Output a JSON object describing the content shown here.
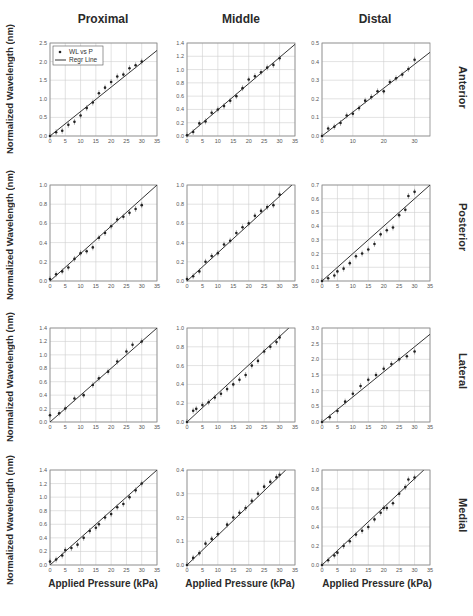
{
  "figure": {
    "column_titles": [
      "Proximal",
      "Middle",
      "Distal"
    ],
    "row_labels": [
      "Anterior",
      "Posterior",
      "Lateral",
      "Medial"
    ],
    "ylabel": "Normalized Wavelength (nm)",
    "xlabel": "Applied Pressure (kPa)",
    "legend": [
      "WL vs P",
      "Regr Line"
    ]
  },
  "chart_data": [
    {
      "type": "scatter",
      "row": "Anterior",
      "col": "Proximal",
      "title": "Proximal",
      "xlabel": "",
      "ylabel": "Normalized Wavelength (nm)",
      "xlim": [
        0,
        35
      ],
      "ylim": [
        0,
        2.5
      ],
      "xticks": [
        0,
        5,
        10,
        15,
        20,
        25,
        30,
        35
      ],
      "yticks": [
        "0.0",
        "0.5",
        "1.0",
        "1.5",
        "2.0",
        "2.5"
      ],
      "legend": [
        "WL vs P",
        "Regr Line"
      ],
      "legend_position": "upper left",
      "grid": true,
      "x": [
        0,
        2,
        4,
        6,
        8,
        10,
        12,
        14,
        16,
        18,
        20,
        22,
        24,
        26,
        28,
        30
      ],
      "y": [
        0.0,
        0.1,
        0.14,
        0.3,
        0.38,
        0.55,
        0.75,
        0.9,
        1.15,
        1.3,
        1.45,
        1.6,
        1.65,
        1.82,
        1.9,
        2.0
      ],
      "regression": [
        [
          0,
          0
        ],
        [
          35,
          2.3
        ]
      ]
    },
    {
      "type": "scatter",
      "row": "Anterior",
      "col": "Middle",
      "title": "Middle",
      "xlim": [
        0,
        35
      ],
      "ylim": [
        0,
        1.4
      ],
      "xticks": [
        0,
        5,
        10,
        15,
        20,
        25,
        30,
        35
      ],
      "yticks": [
        "0.0",
        "0.2",
        "0.4",
        "0.6",
        "0.8",
        "1.0",
        "1.2",
        "1.4"
      ],
      "grid": true,
      "x": [
        0,
        2,
        4,
        6,
        8,
        10,
        12,
        14,
        16,
        18,
        20,
        22,
        24,
        26,
        28,
        30
      ],
      "y": [
        0.01,
        0.06,
        0.19,
        0.22,
        0.35,
        0.4,
        0.45,
        0.53,
        0.6,
        0.72,
        0.85,
        0.9,
        0.96,
        1.03,
        1.07,
        1.17
      ],
      "regression": [
        [
          0,
          0
        ],
        [
          35,
          1.38
        ]
      ]
    },
    {
      "type": "scatter",
      "row": "Anterior",
      "col": "Distal",
      "title": "Distal",
      "xlim": [
        0,
        35
      ],
      "ylim": [
        0,
        0.5
      ],
      "xticks": [
        0,
        10,
        20,
        30
      ],
      "yticks": [
        "0.0",
        "0.1",
        "0.2",
        "0.3",
        "0.4",
        "0.5"
      ],
      "grid": true,
      "x": [
        0,
        2,
        4,
        6,
        8,
        10,
        12,
        14,
        16,
        18,
        20,
        22,
        24,
        26,
        28,
        30
      ],
      "y": [
        0.0,
        0.04,
        0.05,
        0.07,
        0.11,
        0.12,
        0.15,
        0.19,
        0.21,
        0.24,
        0.24,
        0.29,
        0.31,
        0.33,
        0.36,
        0.41
      ],
      "regression": [
        [
          0,
          0
        ],
        [
          35,
          0.45
        ]
      ]
    },
    {
      "type": "scatter",
      "row": "Posterior",
      "col": "Proximal",
      "xlim": [
        0,
        35
      ],
      "ylim": [
        0,
        1.0
      ],
      "xticks": [
        0,
        5,
        10,
        15,
        20,
        25,
        30,
        35
      ],
      "yticks": [
        "0.0",
        "0.2",
        "0.4",
        "0.6",
        "0.8",
        "1.0"
      ],
      "grid": true,
      "x": [
        0,
        2,
        4,
        6,
        8,
        10,
        12,
        14,
        16,
        18,
        20,
        22,
        24,
        26,
        28,
        30
      ],
      "y": [
        0.02,
        0.07,
        0.1,
        0.14,
        0.23,
        0.29,
        0.31,
        0.35,
        0.45,
        0.5,
        0.57,
        0.64,
        0.67,
        0.71,
        0.75,
        0.79,
        0.9
      ],
      "regression": [
        [
          0,
          0
        ],
        [
          35,
          1.0
        ]
      ]
    },
    {
      "type": "scatter",
      "row": "Posterior",
      "col": "Middle",
      "xlim": [
        0,
        35
      ],
      "ylim": [
        0,
        1.0
      ],
      "xticks": [
        0,
        5,
        10,
        15,
        20,
        25,
        30,
        35
      ],
      "yticks": [
        "0.0",
        "0.2",
        "0.4",
        "0.6",
        "0.8",
        "1.0"
      ],
      "grid": true,
      "x": [
        0,
        2,
        4,
        6,
        8,
        10,
        12,
        14,
        16,
        18,
        20,
        22,
        24,
        26,
        28,
        30
      ],
      "y": [
        0.02,
        0.05,
        0.1,
        0.2,
        0.26,
        0.29,
        0.38,
        0.42,
        0.5,
        0.56,
        0.6,
        0.68,
        0.73,
        0.77,
        0.79,
        0.9
      ],
      "regression": [
        [
          0,
          0
        ],
        [
          34,
          1.0
        ]
      ]
    },
    {
      "type": "scatter",
      "row": "Posterior",
      "col": "Distal",
      "xlim": [
        0,
        35
      ],
      "ylim": [
        0,
        0.7
      ],
      "xticks": [
        0,
        5,
        10,
        15,
        20,
        25,
        30,
        35
      ],
      "yticks": [
        "0.0",
        "0.1",
        "0.2",
        "0.3",
        "0.4",
        "0.5",
        "0.6",
        "0.7"
      ],
      "grid": true,
      "x": [
        0,
        2,
        4,
        5,
        7,
        9,
        11,
        13,
        15,
        17,
        19,
        21,
        23,
        25,
        27,
        28,
        30
      ],
      "y": [
        0.0,
        0.02,
        0.04,
        0.07,
        0.09,
        0.13,
        0.18,
        0.2,
        0.23,
        0.27,
        0.34,
        0.37,
        0.39,
        0.48,
        0.52,
        0.62,
        0.65
      ],
      "regression": [
        [
          0,
          0
        ],
        [
          35,
          0.7
        ]
      ]
    },
    {
      "type": "scatter",
      "row": "Lateral",
      "col": "Proximal",
      "ylabel": "Normalized Wavelength (nm)",
      "xlim": [
        0,
        35
      ],
      "ylim": [
        0,
        1.4
      ],
      "xticks": [
        0,
        5,
        10,
        15,
        20,
        25,
        30,
        35
      ],
      "yticks": [
        "0.0",
        "0.2",
        "0.4",
        "0.6",
        "0.8",
        "1.0",
        "1.2",
        "1.4"
      ],
      "grid": true,
      "x": [
        0,
        3,
        5,
        8,
        11,
        14,
        16,
        19,
        22,
        25,
        27,
        30
      ],
      "y": [
        0.1,
        0.13,
        0.2,
        0.35,
        0.4,
        0.55,
        0.65,
        0.75,
        0.9,
        1.05,
        1.15,
        1.2
      ],
      "regression": [
        [
          0,
          0
        ],
        [
          35,
          1.4
        ]
      ]
    },
    {
      "type": "scatter",
      "row": "Lateral",
      "col": "Middle",
      "xlim": [
        0,
        35
      ],
      "ylim": [
        0,
        1.0
      ],
      "xticks": [
        0,
        5,
        10,
        15,
        20,
        25,
        30,
        35
      ],
      "yticks": [
        "0.0",
        "0.2",
        "0.4",
        "0.6",
        "0.8",
        "1.0"
      ],
      "grid": true,
      "x": [
        0,
        2,
        3,
        5,
        7,
        9,
        11,
        13,
        15,
        17,
        19,
        21,
        23,
        25,
        27,
        29,
        30
      ],
      "y": [
        0.0,
        0.12,
        0.14,
        0.18,
        0.21,
        0.26,
        0.3,
        0.35,
        0.4,
        0.45,
        0.5,
        0.6,
        0.65,
        0.75,
        0.8,
        0.85,
        0.9
      ],
      "regression": [
        [
          0,
          0
        ],
        [
          33,
          1.0
        ]
      ]
    },
    {
      "type": "scatter",
      "row": "Lateral",
      "col": "Distal",
      "xlim": [
        0,
        35
      ],
      "ylim": [
        0,
        3.0
      ],
      "xticks": [
        0,
        5,
        10,
        15,
        20,
        25,
        30,
        35
      ],
      "yticks": [
        "0.0",
        "0.5",
        "1.0",
        "1.5",
        "2.0",
        "2.5",
        "3.0"
      ],
      "grid": true,
      "x": [
        0,
        2.5,
        5,
        7.5,
        10,
        12.5,
        15,
        17.5,
        20,
        22.5,
        25,
        27.5,
        30
      ],
      "y": [
        0.0,
        0.15,
        0.35,
        0.65,
        0.9,
        1.15,
        1.35,
        1.5,
        1.7,
        1.85,
        2.0,
        2.1,
        2.25
      ],
      "regression": [
        [
          0,
          0
        ],
        [
          35,
          2.8
        ]
      ]
    },
    {
      "type": "scatter",
      "row": "Medial",
      "col": "Proximal",
      "ylabel": "Normalized Wavelength (nm)",
      "xlabel": "Applied Pressure (kPa)",
      "xlim": [
        0,
        35
      ],
      "ylim": [
        0,
        1.4
      ],
      "xticks": [
        0,
        5,
        10,
        15,
        20,
        25,
        30,
        35
      ],
      "yticks": [
        "0.0",
        "0.2",
        "0.4",
        "0.6",
        "0.8",
        "1.0",
        "1.2",
        "1.4"
      ],
      "grid": true,
      "x": [
        0,
        2,
        4,
        5,
        7,
        9,
        11,
        13,
        15,
        16,
        18,
        20,
        22,
        24,
        26,
        28,
        30
      ],
      "y": [
        0.05,
        0.08,
        0.14,
        0.22,
        0.25,
        0.3,
        0.4,
        0.5,
        0.55,
        0.6,
        0.7,
        0.75,
        0.85,
        0.9,
        1.0,
        1.1,
        1.2
      ],
      "regression": [
        [
          0,
          0
        ],
        [
          35,
          1.4
        ]
      ]
    },
    {
      "type": "scatter",
      "row": "Medial",
      "col": "Middle",
      "xlabel": "Applied Pressure (kPa)",
      "xlim": [
        0,
        35
      ],
      "ylim": [
        0,
        0.4
      ],
      "xticks": [
        0,
        5,
        10,
        15,
        20,
        25,
        30,
        35
      ],
      "yticks": [
        "0.0",
        "0.1",
        "0.2",
        "0.3",
        "0.4"
      ],
      "grid": true,
      "x": [
        0,
        2,
        4,
        6,
        8,
        10,
        13,
        15,
        17,
        19,
        21,
        23,
        25,
        27,
        29,
        30
      ],
      "y": [
        0.0,
        0.03,
        0.05,
        0.09,
        0.11,
        0.13,
        0.17,
        0.2,
        0.22,
        0.24,
        0.27,
        0.3,
        0.33,
        0.35,
        0.37,
        0.38
      ],
      "regression": [
        [
          0,
          0
        ],
        [
          32,
          0.4
        ]
      ]
    },
    {
      "type": "scatter",
      "row": "Medial",
      "col": "Distal",
      "xlabel": "Applied Pressure (kPa)",
      "xlim": [
        0,
        35
      ],
      "ylim": [
        0,
        1.0
      ],
      "xticks": [
        0,
        5,
        10,
        15,
        20,
        25,
        30,
        35
      ],
      "yticks": [
        "0.0",
        "0.2",
        "0.4",
        "0.6",
        "0.8",
        "1.0"
      ],
      "grid": true,
      "x": [
        0,
        2,
        4,
        5,
        7,
        9,
        11,
        13,
        15,
        17,
        19,
        20,
        21,
        23,
        25,
        27,
        28,
        30
      ],
      "y": [
        0.0,
        0.05,
        0.1,
        0.13,
        0.2,
        0.25,
        0.32,
        0.36,
        0.4,
        0.48,
        0.55,
        0.6,
        0.6,
        0.65,
        0.75,
        0.82,
        0.9,
        0.92
      ],
      "regression": [
        [
          0,
          0
        ],
        [
          33,
          1.0
        ]
      ]
    }
  ]
}
